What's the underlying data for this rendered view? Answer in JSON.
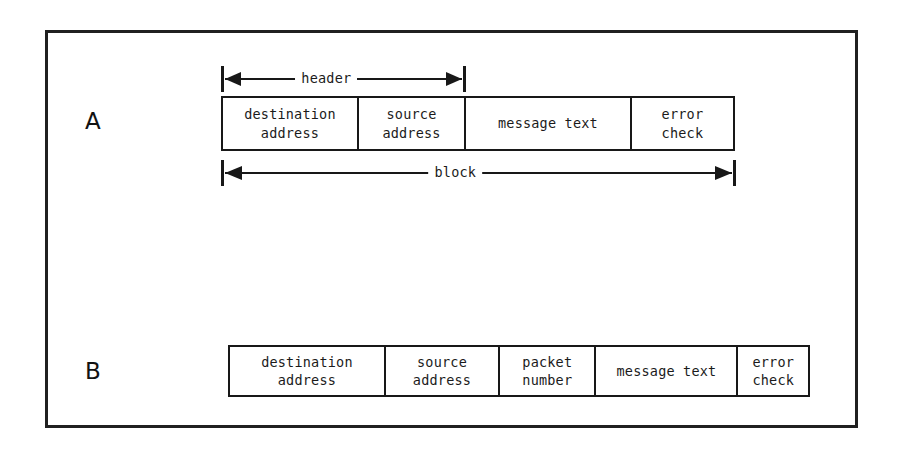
{
  "figure": {
    "background_color": "#ffffff",
    "line_color": "#181818",
    "frame_border_color": "#202020"
  },
  "parts": [
    {
      "id": "a",
      "label": "A",
      "fields": [
        {
          "name": "destination-address",
          "text": "destination\naddress"
        },
        {
          "name": "source-address",
          "text": "source\naddress"
        },
        {
          "name": "message-text",
          "text": "message text"
        },
        {
          "name": "error-check",
          "text": "error\ncheck"
        }
      ],
      "dimensions": [
        {
          "name": "header",
          "label": "header"
        },
        {
          "name": "block",
          "label": "block"
        }
      ]
    },
    {
      "id": "b",
      "label": "B",
      "fields": [
        {
          "name": "destination-address",
          "text": "destination\naddress"
        },
        {
          "name": "source-address",
          "text": "source\naddress"
        },
        {
          "name": "packet-number",
          "text": "packet\nnumber"
        },
        {
          "name": "message-text",
          "text": "message text"
        },
        {
          "name": "error-check",
          "text": "error\ncheck"
        }
      ],
      "dimensions": []
    }
  ]
}
